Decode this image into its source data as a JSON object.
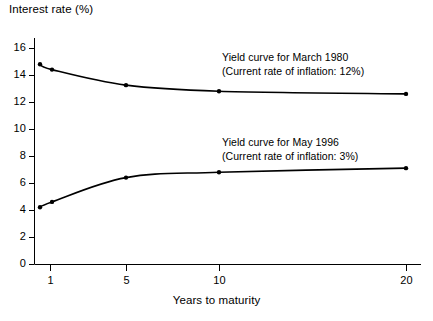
{
  "chart_data": {
    "type": "line",
    "title": "",
    "xlabel": "Years to maturity",
    "ylabel": "Interest rate (%)",
    "x": [
      1,
      2,
      5,
      10,
      20
    ],
    "xticks": [
      1,
      5,
      10,
      20
    ],
    "xtick_labels": [
      "1",
      "5",
      "10",
      "20"
    ],
    "yticks": [
      0,
      2,
      4,
      6,
      8,
      10,
      12,
      14,
      16
    ],
    "ytick_labels": [
      "0",
      "2",
      "4",
      "6",
      "8",
      "10",
      "12",
      "14",
      "16"
    ],
    "xlim": [
      1,
      20
    ],
    "ylim": [
      0,
      16
    ],
    "grid": false,
    "legend": "none",
    "markers": "filled-circle",
    "line_color": "#000000",
    "series": [
      {
        "name": "Yield curve for March 1980",
        "values": [
          14.8,
          14.4,
          13.25,
          12.8,
          12.6
        ],
        "annotation": {
          "line1": "Yield curve for March 1980",
          "line2": "(Current rate of inflation: 12%)"
        }
      },
      {
        "name": "Yield curve for May 1996",
        "values": [
          4.2,
          4.6,
          6.4,
          6.8,
          7.1
        ],
        "annotation": {
          "line1": "Yield curve for May 1996",
          "line2": "(Current rate of inflation: 3%)"
        }
      }
    ]
  },
  "axes": {
    "y_axis_title": "Interest rate (%)",
    "x_axis_title": "Years to maturity"
  },
  "annotations": {
    "curve_1980_line1": "Yield curve for March 1980",
    "curve_1980_line2": "(Current rate of inflation: 12%)",
    "curve_1996_line1": "Yield curve for May 1996",
    "curve_1996_line2": "(Current rate of inflation: 3%)"
  },
  "colors": {
    "background": "#ffffff",
    "ink": "#000000"
  }
}
